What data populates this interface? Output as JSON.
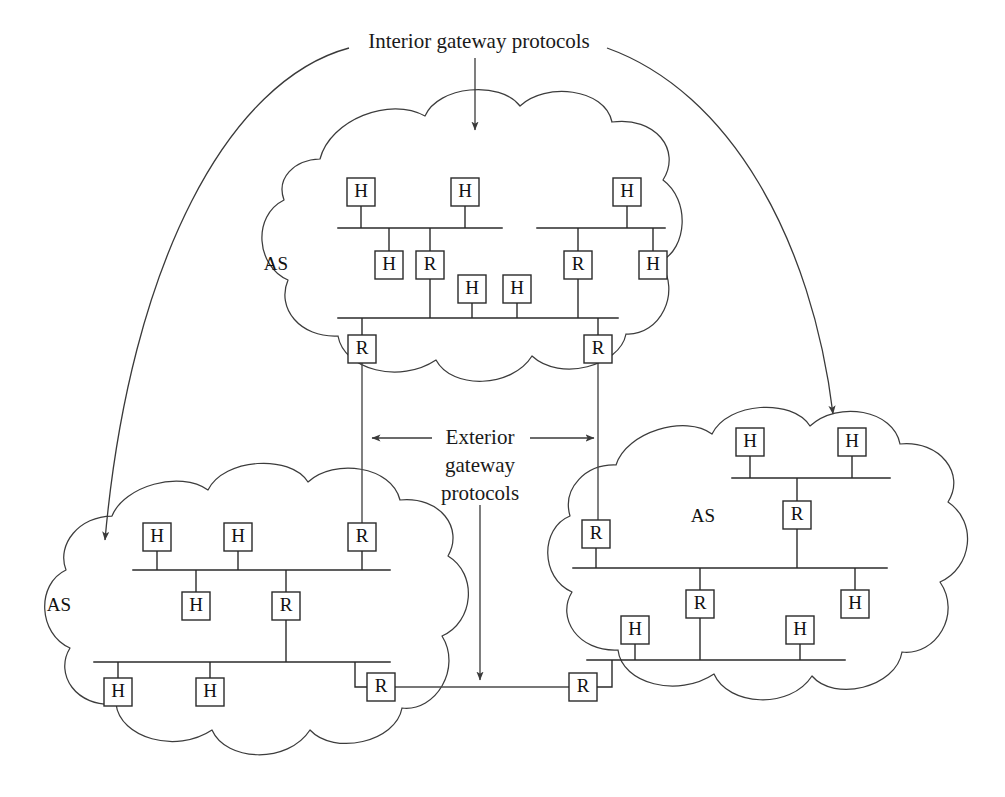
{
  "figure": {
    "title": "Interior gateway protocols",
    "exterior_label_lines": [
      "Exterior",
      "gateway",
      "protocols"
    ],
    "as_label": "AS",
    "host_label": "H",
    "router_label": "R",
    "line_color": "#2a2a2a",
    "cloud_color": "#3c3c3c",
    "background": "#ffffff"
  },
  "autonomous_systems": [
    {
      "id": "as-top",
      "label": "AS",
      "label_pos": {
        "x": 276,
        "y": 266
      },
      "buses": [
        {
          "id": "as-top-bus-left-upper",
          "x1": 338,
          "x2": 502,
          "y": 228,
          "nodes": [
            {
              "type": "H",
              "label": "H",
              "x": 361,
              "y": 192,
              "side": "above"
            },
            {
              "type": "H",
              "label": "H",
              "x": 465,
              "y": 192,
              "side": "above"
            },
            {
              "type": "H",
              "label": "H",
              "x": 389,
              "y": 265,
              "side": "below"
            },
            {
              "type": "R",
              "label": "R",
              "x": 430,
              "y": 265,
              "side": "below"
            }
          ]
        },
        {
          "id": "as-top-bus-right-upper",
          "x1": 537,
          "x2": 665,
          "y": 228,
          "nodes": [
            {
              "type": "H",
              "label": "H",
              "x": 627,
              "y": 192,
              "side": "above"
            },
            {
              "type": "R",
              "label": "R",
              "x": 578,
              "y": 265,
              "side": "below"
            },
            {
              "type": "H",
              "label": "H",
              "x": 653,
              "y": 265,
              "side": "below"
            }
          ]
        },
        {
          "id": "as-top-bus-lower",
          "x1": 338,
          "x2": 618,
          "y": 318,
          "nodes": [
            {
              "type": "H",
              "label": "H",
              "x": 472,
              "y": 289,
              "side": "above"
            },
            {
              "type": "H",
              "label": "H",
              "x": 517,
              "y": 289,
              "side": "above"
            },
            {
              "type": "R",
              "label": "R",
              "x": 362,
              "y": 349,
              "side": "below"
            },
            {
              "type": "R",
              "label": "R",
              "x": 598,
              "y": 349,
              "side": "below"
            }
          ]
        }
      ]
    },
    {
      "id": "as-bottom-left",
      "label": "AS",
      "label_pos": {
        "x": 59,
        "y": 607
      },
      "buses": [
        {
          "id": "as-bl-bus-upper",
          "x1": 133,
          "x2": 390,
          "y": 570,
          "nodes": [
            {
              "type": "H",
              "label": "H",
              "x": 157,
              "y": 537,
              "side": "above"
            },
            {
              "type": "H",
              "label": "H",
              "x": 238,
              "y": 537,
              "side": "above"
            },
            {
              "type": "R",
              "label": "R",
              "x": 362,
              "y": 537,
              "side": "above"
            },
            {
              "type": "H",
              "label": "H",
              "x": 196,
              "y": 606,
              "side": "below"
            },
            {
              "type": "R",
              "label": "R",
              "x": 286,
              "y": 606,
              "side": "below"
            }
          ]
        },
        {
          "id": "as-bl-bus-lower",
          "x1": 94,
          "x2": 390,
          "y": 662,
          "nodes": [
            {
              "type": "H",
              "label": "H",
              "x": 118,
              "y": 692,
              "side": "below"
            },
            {
              "type": "H",
              "label": "H",
              "x": 210,
              "y": 692,
              "side": "below"
            },
            {
              "type": "R",
              "label": "R",
              "x": 381,
              "y": 687,
              "side": "step-right"
            }
          ]
        }
      ]
    },
    {
      "id": "as-bottom-right",
      "label": "AS",
      "label_pos": {
        "x": 703,
        "y": 518
      },
      "buses": [
        {
          "id": "as-br-bus-upper",
          "x1": 732,
          "x2": 890,
          "y": 478,
          "nodes": [
            {
              "type": "H",
              "label": "H",
              "x": 750,
              "y": 442,
              "side": "above"
            },
            {
              "type": "H",
              "label": "H",
              "x": 852,
              "y": 442,
              "side": "above"
            },
            {
              "type": "R",
              "label": "R",
              "x": 797,
              "y": 515,
              "side": "below"
            }
          ]
        },
        {
          "id": "as-br-bus-lower",
          "x1": 573,
          "x2": 887,
          "y": 568,
          "nodes": [
            {
              "type": "R",
              "label": "R",
              "x": 596,
              "y": 534,
              "side": "above"
            },
            {
              "type": "R",
              "label": "R",
              "x": 700,
              "y": 604,
              "side": "below"
            },
            {
              "type": "H",
              "label": "H",
              "x": 855,
              "y": 604,
              "side": "below"
            }
          ]
        },
        {
          "id": "as-br-bus-bottom",
          "x1": 587,
          "x2": 845,
          "y": 660,
          "nodes": [
            {
              "type": "H",
              "label": "H",
              "x": 635,
              "y": 630,
              "side": "above"
            },
            {
              "type": "H",
              "label": "H",
              "x": 800,
              "y": 630,
              "side": "above"
            },
            {
              "type": "R",
              "label": "R",
              "x": 583,
              "y": 687,
              "side": "step-left"
            }
          ]
        }
      ]
    }
  ],
  "annotations": {
    "interior_arrow_down": {
      "from_x": 475,
      "from_y": 58,
      "to_x": 475,
      "to_y": 130
    },
    "interior_arrow_left": {
      "start_x": 349,
      "start_y": 48,
      "end_x": 105,
      "end_y": 548
    },
    "interior_arrow_right": {
      "start_x": 607,
      "start_y": 48,
      "end_x": 833,
      "end_y": 423
    },
    "exterior_arrow_left": {
      "from_x": 432,
      "from_y": 438,
      "to_x": 368,
      "to_y": 438
    },
    "exterior_arrow_right": {
      "from_x": 530,
      "from_y": 438,
      "to_x": 598,
      "to_y": 438
    },
    "exterior_arrow_down": {
      "from_x": 480,
      "from_y": 505,
      "to_x": 480,
      "to_y": 684
    }
  }
}
